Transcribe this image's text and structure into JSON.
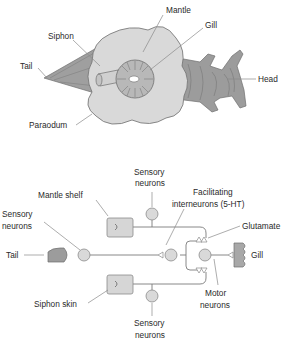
{
  "anatomy": {
    "labels": {
      "mantle": "Mantle",
      "gill": "Gill",
      "siphon": "Siphon",
      "tail": "Tail",
      "head": "Head",
      "paraodum": "Paraodum"
    }
  },
  "circuit": {
    "labels": {
      "sensory_top_1": "Sensory",
      "sensory_top_2": "neurons",
      "mantle_shelf": "Mantle shelf",
      "facilitating_1": "Facilitating",
      "facilitating_2": "interneurons (5-HT)",
      "sensory_left_1": "Sensory",
      "sensory_left_2": "neurons",
      "glutamate": "Glutamate",
      "tail": "Tail",
      "gill": "Gill",
      "siphon_skin": "Siphon skin",
      "motor_1": "Motor",
      "motor_2": "neurons",
      "sensory_bottom_1": "Sensory",
      "sensory_bottom_2": "neurons"
    }
  },
  "colors": {
    "body_light": "#d9d9d9",
    "body_dark": "#9a9a9a",
    "outline": "#6e6e6e"
  }
}
